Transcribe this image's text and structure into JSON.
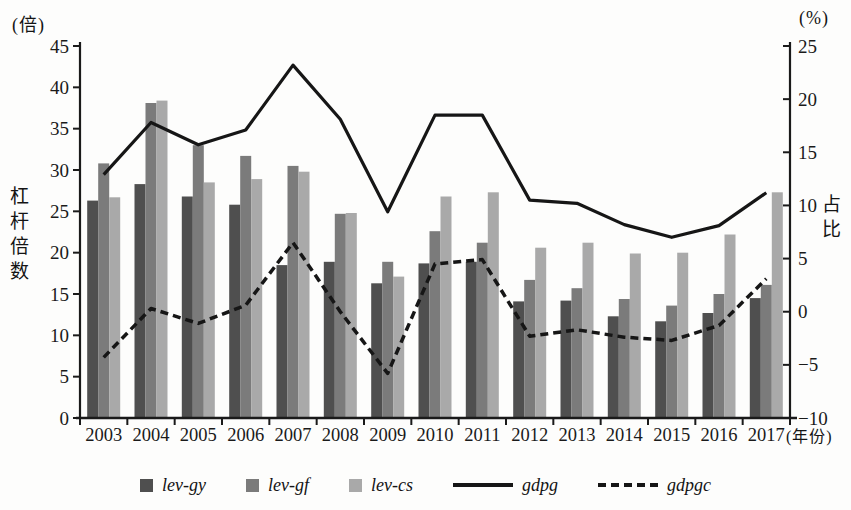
{
  "chart_data": {
    "type": "bar+line-combo",
    "categories": [
      "2003",
      "2004",
      "2005",
      "2006",
      "2007",
      "2008",
      "2009",
      "2010",
      "2011",
      "2012",
      "2013",
      "2014",
      "2015",
      "2016",
      "2017"
    ],
    "series": [
      {
        "name": "lev-gy",
        "type": "bar",
        "axis": "left",
        "color": "#4f4f4f",
        "values": [
          26.3,
          28.3,
          26.8,
          25.8,
          18.5,
          18.9,
          16.3,
          18.7,
          18.9,
          14.1,
          14.2,
          12.3,
          11.7,
          12.7,
          14.5
        ]
      },
      {
        "name": "lev-gf",
        "type": "bar",
        "axis": "left",
        "color": "#7b7b7b",
        "values": [
          30.8,
          38.1,
          33.0,
          31.7,
          30.5,
          24.7,
          18.9,
          22.6,
          21.2,
          16.7,
          15.7,
          14.4,
          13.6,
          15.0,
          16.1
        ]
      },
      {
        "name": "lev-cs",
        "type": "bar",
        "axis": "left",
        "color": "#a9a9a9",
        "values": [
          26.7,
          38.4,
          28.5,
          28.9,
          29.8,
          24.8,
          17.1,
          26.8,
          27.3,
          20.6,
          21.2,
          19.9,
          20.0,
          22.2,
          27.3
        ]
      },
      {
        "name": "gdpg",
        "type": "line",
        "style": "solid",
        "axis": "right",
        "color": "#161616",
        "values": [
          12.9,
          17.8,
          15.7,
          17.1,
          23.2,
          18.1,
          9.4,
          18.5,
          18.5,
          10.5,
          10.2,
          8.2,
          7.0,
          8.1,
          11.2
        ]
      },
      {
        "name": "gdpgc",
        "type": "line",
        "style": "dashed",
        "axis": "right",
        "color": "#161616",
        "values": [
          -4.3,
          0.3,
          -1.1,
          0.6,
          6.5,
          0.0,
          -5.8,
          4.5,
          4.9,
          -2.3,
          -1.7,
          -2.4,
          -2.7,
          -1.3,
          3.1
        ]
      }
    ],
    "left_axis": {
      "min": 0,
      "max": 45,
      "step": 5,
      "unit": "(倍)",
      "title": "杠杆倍数"
    },
    "right_axis": {
      "min": -10,
      "max": 25,
      "step": 5,
      "unit": "(%)",
      "title": "占比"
    },
    "x_axis": {
      "unit": "(年份)"
    },
    "grid": false,
    "legend_position": "bottom"
  },
  "legend": {
    "items": [
      {
        "label": "lev-gy",
        "swatch": "square",
        "color": "#4f4f4f"
      },
      {
        "label": "lev-gf",
        "swatch": "square",
        "color": "#7b7b7b"
      },
      {
        "label": "lev-cs",
        "swatch": "square",
        "color": "#a9a9a9"
      },
      {
        "label": "gdpg",
        "swatch": "solid-line",
        "color": "#161616"
      },
      {
        "label": "gdpgc",
        "swatch": "dashed-line",
        "color": "#161616"
      }
    ]
  }
}
